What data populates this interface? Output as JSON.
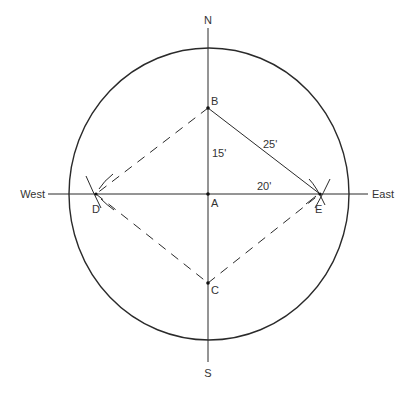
{
  "diagram": {
    "colors": {
      "line": "#2a2a2a",
      "text": "#333333",
      "background": "#ffffff"
    },
    "compass": {
      "north": "N",
      "south": "S",
      "east": "East",
      "west": "West"
    },
    "points": {
      "A": "A",
      "B": "B",
      "C": "C",
      "D": "D",
      "E": "E"
    },
    "measurements": {
      "AB": "15'",
      "AE": "20'",
      "BE": "25'"
    },
    "geometry": {
      "center": [
        209,
        194
      ],
      "circle_rx": 140,
      "circle_ry": 146,
      "A": [
        208,
        194
      ],
      "B": [
        208,
        108
      ],
      "C": [
        208,
        283
      ],
      "D": [
        96,
        194
      ],
      "E": [
        320,
        194
      ]
    }
  }
}
